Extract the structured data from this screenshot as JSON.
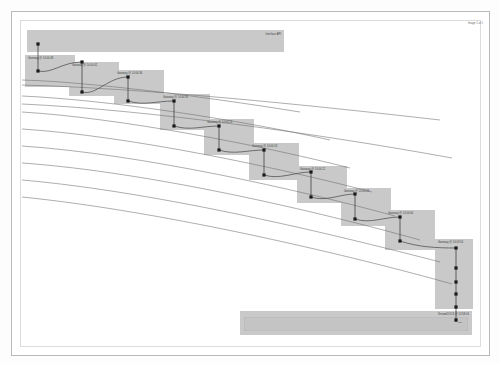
{
  "page": {
    "corner_label": "Image 1 of 1",
    "background_color": "#ffffff",
    "frame_color": "#b9b9b9",
    "box_color": "#c9c9c9",
    "marker_color": "#1a1a1a",
    "line_color": "#555555"
  },
  "top_banner": {
    "label": "Interface API",
    "x": 27,
    "y": 30,
    "width": 257,
    "height": 22
  },
  "bottom_banner": {
    "label": "StreamDOCS @ 13:58:04",
    "note": "Ref",
    "x": 240,
    "y": 311,
    "width": 232,
    "height": 24
  },
  "boxes": [
    {
      "label": "Gateway @ 14:04:48",
      "x": 25,
      "y": 55,
      "width": 50,
      "height": 32
    },
    {
      "label": "Gateway @ 14:04:42",
      "x": 69,
      "y": 62,
      "width": 50,
      "height": 34
    },
    {
      "label": "Gateway @ 14:04:36",
      "x": 114,
      "y": 70,
      "width": 50,
      "height": 34
    },
    {
      "label": "Gateway @ 14:04:30",
      "x": 160,
      "y": 94,
      "width": 50,
      "height": 36
    },
    {
      "label": "Gateway @ 14:04:24",
      "x": 204,
      "y": 119,
      "width": 50,
      "height": 36
    },
    {
      "label": "Gateway @ 14:04:18",
      "x": 249,
      "y": 143,
      "width": 50,
      "height": 37
    },
    {
      "label": "Gateway @ 14:04:12",
      "x": 297,
      "y": 166,
      "width": 50,
      "height": 37
    },
    {
      "label": "Gateway @ 14:04:06",
      "x": 341,
      "y": 188,
      "width": 50,
      "height": 38
    },
    {
      "label": "Gateway @ 14:04:00",
      "x": 385,
      "y": 210,
      "width": 50,
      "height": 40
    },
    {
      "label": "Gateway @ 14:03:54",
      "x": 435,
      "y": 239,
      "width": 38,
      "height": 70
    }
  ],
  "markers": [
    {
      "cx": 38,
      "cy": 44
    },
    {
      "cx": 38,
      "cy": 71
    },
    {
      "cx": 82,
      "cy": 62
    },
    {
      "cx": 82,
      "cy": 92
    },
    {
      "cx": 128,
      "cy": 77
    },
    {
      "cx": 128,
      "cy": 101
    },
    {
      "cx": 174,
      "cy": 101
    },
    {
      "cx": 174,
      "cy": 126
    },
    {
      "cx": 219,
      "cy": 126
    },
    {
      "cx": 219,
      "cy": 150
    },
    {
      "cx": 264,
      "cy": 150
    },
    {
      "cx": 264,
      "cy": 175
    },
    {
      "cx": 311,
      "cy": 172
    },
    {
      "cx": 311,
      "cy": 197
    },
    {
      "cx": 355,
      "cy": 194
    },
    {
      "cx": 355,
      "cy": 219
    },
    {
      "cx": 400,
      "cy": 217
    },
    {
      "cx": 400,
      "cy": 241
    },
    {
      "cx": 456,
      "cy": 248
    },
    {
      "cx": 456,
      "cy": 268
    },
    {
      "cx": 456,
      "cy": 282
    },
    {
      "cx": 456,
      "cy": 294
    },
    {
      "cx": 456,
      "cy": 307
    },
    {
      "cx": 456,
      "cy": 320
    }
  ],
  "lifelines": [
    {
      "x": 38,
      "y1": 44,
      "y2": 71
    },
    {
      "x": 82,
      "y1": 62,
      "y2": 92
    },
    {
      "x": 128,
      "y1": 77,
      "y2": 101
    },
    {
      "x": 174,
      "y1": 101,
      "y2": 126
    },
    {
      "x": 219,
      "y1": 126,
      "y2": 150
    },
    {
      "x": 264,
      "y1": 150,
      "y2": 175
    },
    {
      "x": 311,
      "y1": 172,
      "y2": 197
    },
    {
      "x": 355,
      "y1": 194,
      "y2": 219
    },
    {
      "x": 400,
      "y1": 217,
      "y2": 241
    },
    {
      "x": 456,
      "y1": 248,
      "y2": 322
    }
  ],
  "step_curves": [
    "M 38 71 C 52 74 62 62 82 62",
    "M 82 92 C 96 96 108 77 128 77",
    "M 128 101 C 144 106 156 101 174 101",
    "M 174 126 C 190 131 202 126 219 126",
    "M 219 150 C 234 155 248 150 264 150",
    "M 264 175 C 280 180 294 172 311 172",
    "M 311 197 C 326 202 340 194 355 194",
    "M 355 219 C 370 224 384 217 400 217",
    "M 400 241 C 418 247 436 248 456 248"
  ],
  "sweep_curves": [
    "M 22 80  C 90 82 200 96 300 112",
    "M 22 96  C 110 100 240 120 330 140",
    "M 22 112 C 120 118 260 145 350 168",
    "M 22 129 C 130 136 280 168 372 192",
    "M 22 146 C 140 154 300 190 395 216",
    "M 22 163 C 150 172 320 212 420 240",
    "M 22 180 C 160 192 340 236 440 262",
    "M 22 197 C 170 212 360 258 452 284"
  ],
  "through_curves": [
    "M 22 85  C 140 88 300 104 440 120",
    "M 22 104 C 150 110 320 134 452 158"
  ]
}
